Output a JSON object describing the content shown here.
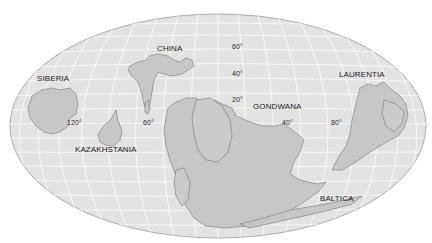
{
  "map": {
    "projection": "elliptical (Mollweide-style) world projection",
    "colors": {
      "background": "#ffffff",
      "ocean": "#e3e3e3",
      "graticule": "#f8f8f8",
      "land": "#c7c7c7",
      "land_outline": "#858585",
      "ellipse_outline": "#9a9a9a",
      "label_text": "#1a1a1a"
    },
    "continent_labels": [
      {
        "name": "SIBERIA",
        "x": 37,
        "y": 75
      },
      {
        "name": "CHINA",
        "x": 157,
        "y": 45
      },
      {
        "name": "LAURENTIA",
        "x": 339,
        "y": 71
      },
      {
        "name": "GONDWANA",
        "x": 253,
        "y": 103
      },
      {
        "name": "KAZAKHSTANIA",
        "x": 75,
        "y": 146
      },
      {
        "name": "BALTICA",
        "x": 320,
        "y": 195
      }
    ],
    "latitude_labels": [
      {
        "text": "60°",
        "x": 232,
        "y": 43
      },
      {
        "text": "40°",
        "x": 232,
        "y": 70
      },
      {
        "text": "20°",
        "x": 232,
        "y": 96
      }
    ],
    "longitude_labels": [
      {
        "text": "120°",
        "x": 67,
        "y": 119
      },
      {
        "text": "60°",
        "x": 143,
        "y": 119
      },
      {
        "text": "40°",
        "x": 282,
        "y": 119
      },
      {
        "text": "80°",
        "x": 331,
        "y": 119
      }
    ]
  }
}
